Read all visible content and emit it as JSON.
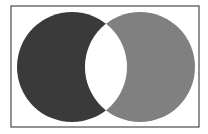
{
  "diagram": {
    "type": "venn-symmetric-difference",
    "frame": {
      "x": 11,
      "y": 6,
      "width": 188,
      "height": 121,
      "stroke": "#4a4a4a"
    },
    "sets": [
      {
        "id": "A",
        "cx": 72,
        "cy": 67,
        "r": 55,
        "fill": "#3a3a3a"
      },
      {
        "id": "B",
        "cx": 140,
        "cy": 67,
        "r": 55,
        "fill": "#808080"
      }
    ],
    "intersection_fill": "#ffffff"
  }
}
